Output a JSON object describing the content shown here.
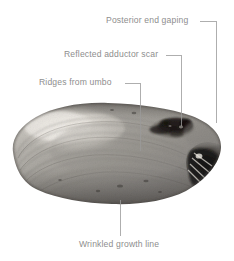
{
  "figure": {
    "background_color": "#ffffff",
    "label_color": "#8e8e8e",
    "leader_color": "#9a9a9a",
    "width": 234,
    "height": 261
  },
  "callouts": [
    {
      "id": "posterior-end-gaping",
      "label": "Posterior end gaping",
      "label_x": 106,
      "label_y": 15,
      "leader": {
        "elbow_x": 216,
        "elbow_y": 21,
        "start_x": 200,
        "end_y": 123
      }
    },
    {
      "id": "reflected-adductor-scar",
      "label": "Reflected adductor scar",
      "label_x": 64,
      "label_y": 49,
      "leader": {
        "elbow_x": 181,
        "elbow_y": 55,
        "start_x": 166,
        "end_y": 126
      }
    },
    {
      "id": "ridges-from-umbo",
      "label": "Ridges from umbo",
      "label_x": 39,
      "label_y": 77,
      "leader": {
        "elbow_x": 140,
        "elbow_y": 83,
        "start_x": 125,
        "end_y": 151
      }
    },
    {
      "id": "wrinkled-growth-line",
      "label": "Wrinkled growth line",
      "label_x": 79,
      "label_y": 239,
      "leader": {
        "elbow_x": 120,
        "elbow_y": 200,
        "start_x": 120,
        "end_y": 236
      }
    }
  ],
  "specimen": {
    "name": "mussel-shell",
    "description": "Grayscale photograph of a mussel shell, anterior to the left, posterior to the right",
    "bounds": {
      "x": 8,
      "y": 104,
      "width": 214,
      "height": 101
    },
    "features": [
      {
        "name": "eroded-umbo",
        "tone": "pale"
      },
      {
        "name": "concentric-growth-ridges",
        "tone": "mid-gray"
      },
      {
        "name": "adductor-scar-patch",
        "tone": "dark"
      },
      {
        "name": "posterior-gape",
        "tone": "very-dark"
      }
    ]
  }
}
